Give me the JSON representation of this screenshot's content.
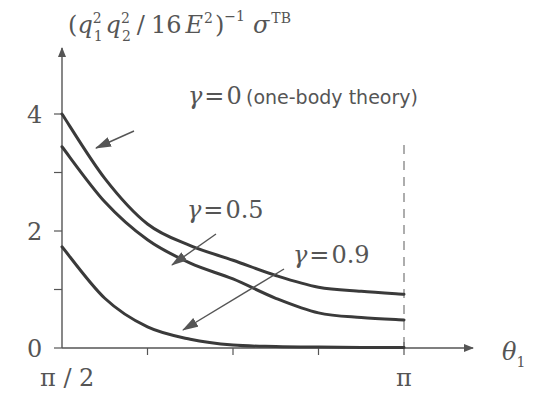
{
  "chart_data": {
    "type": "line",
    "title": "",
    "ylabel": "(q1^2 q2^2 / 16 E^2)^-1 σ^TB",
    "ylabel_parts": {
      "open": "(",
      "q1": "q",
      "sub1": "1",
      "sup1": "2",
      "q2": "q",
      "sub2": "2",
      "sup2": "2",
      "slash": "/",
      "num": "16",
      "E": "E",
      "supE": "2",
      "close": ")",
      "supClose": "−1",
      "sigma": "σ",
      "supSigma": "TB"
    },
    "xlabel": "θ1",
    "xlabel_parts": {
      "theta": "θ",
      "sub": "1"
    },
    "xlim": [
      1.5708,
      3.1416
    ],
    "ylim": [
      0,
      4.7
    ],
    "x_tick_labels": [
      {
        "pos": 0,
        "label": "π / 2"
      },
      {
        "pos": 1,
        "label": "π"
      }
    ],
    "x_minor_ticks": [
      0.25,
      0.5,
      0.75
    ],
    "y_tick_labels": [
      {
        "value": 0,
        "label": "0"
      },
      {
        "value": 2,
        "label": "2"
      },
      {
        "value": 4,
        "label": "4"
      }
    ],
    "y_minor_ticks": [
      1,
      3
    ],
    "grid": false,
    "x_normalized": [
      0,
      0.125,
      0.25,
      0.375,
      0.5,
      0.625,
      0.75,
      0.875,
      1.0
    ],
    "series": [
      {
        "name": "γ = 0 (one-body theory)",
        "gamma": "0",
        "values": [
          4.0,
          2.9,
          2.12,
          1.75,
          1.5,
          1.24,
          1.04,
          0.97,
          0.92
        ]
      },
      {
        "name": "γ = 0.5",
        "gamma": "0.5",
        "values": [
          3.44,
          2.5,
          1.85,
          1.45,
          1.18,
          0.85,
          0.6,
          0.52,
          0.48
        ]
      },
      {
        "name": "γ = 0.9",
        "gamma": "0.9",
        "values": [
          1.73,
          0.85,
          0.36,
          0.15,
          0.05,
          0.025,
          0.015,
          0.01,
          0.01
        ]
      }
    ],
    "annotations": [
      {
        "text_gamma": "γ",
        "text_eq": "=",
        "text_val": "0",
        "text_note": "(one-body theory)",
        "series": 0
      },
      {
        "text_gamma": "γ",
        "text_eq": "=",
        "text_val": "0.5",
        "series": 1
      },
      {
        "text_gamma": "γ",
        "text_eq": "=",
        "text_val": "0.9",
        "series": 2
      }
    ],
    "reference_line": {
      "type": "vertical-dashed",
      "at": "π"
    }
  }
}
